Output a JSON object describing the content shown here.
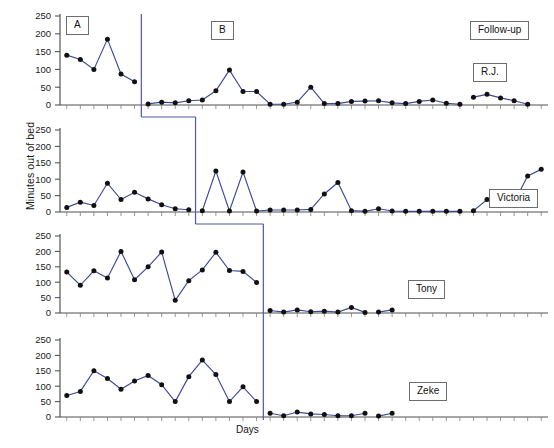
{
  "figure": {
    "ylabel": "Minutes out of bed",
    "xlabel": "Days",
    "phase_labels": [
      {
        "text": "A",
        "x": 66,
        "y": 16
      },
      {
        "text": "B",
        "x": 211,
        "y": 21
      },
      {
        "text": "Follow-up",
        "x": 470,
        "y": 21
      }
    ],
    "subject_labels": [
      {
        "text": "R.J.",
        "x": 473,
        "y": 63
      },
      {
        "text": "Victoria",
        "x": 489,
        "y": 189
      },
      {
        "text": "Tony",
        "x": 408,
        "y": 280
      },
      {
        "text": "Zeke",
        "x": 409,
        "y": 382
      }
    ],
    "colors": {
      "line": "#3d4a9c",
      "marker": "#111111",
      "axis": "#8a8a8a",
      "phase_line": "#4a5aa8",
      "box_border": "#6e6e6e",
      "text": "#1a1a1a",
      "background": "#ffffff"
    }
  },
  "chart_data": {
    "type": "line",
    "title": "",
    "xlabel": "Days",
    "ylabel": "Minutes out of bed",
    "ylim": [
      0,
      250
    ],
    "yticks": [
      0,
      50,
      100,
      150,
      200,
      250
    ],
    "grid": false,
    "legend": "none",
    "design": "multiple-baseline across participants (A / B / Follow-up phases)",
    "panels": [
      {
        "name": "R.J.",
        "phase_change_day": 7,
        "followup_start_day": 31,
        "series": [
          {
            "name": "A",
            "x": [
              1,
              2,
              3,
              4,
              5,
              6
            ],
            "values": [
              140,
              128,
              100,
              185,
              87,
              65
            ]
          },
          {
            "name": "B",
            "x": [
              7,
              8,
              9,
              10,
              11,
              12,
              13,
              14,
              15,
              16,
              17,
              18,
              19,
              20,
              21,
              22,
              23,
              24,
              25,
              26,
              27,
              28,
              29,
              30
            ],
            "values": [
              3,
              8,
              6,
              12,
              14,
              40,
              98,
              38,
              38,
              2,
              2,
              8,
              50,
              4,
              4,
              10,
              11,
              12,
              6,
              4,
              10,
              14,
              5,
              2
            ]
          },
          {
            "name": "Follow-up",
            "x": [
              31,
              32,
              33,
              34,
              35
            ],
            "values": [
              22,
              30,
              20,
              12,
              2
            ]
          }
        ]
      },
      {
        "name": "Victoria",
        "phase_change_day": 11,
        "followup_start_day": 31,
        "series": [
          {
            "name": "A",
            "x": [
              1,
              2,
              3,
              4,
              5,
              6,
              7,
              8,
              9,
              10
            ],
            "values": [
              14,
              30,
              20,
              88,
              38,
              60,
              40,
              22,
              10,
              7
            ]
          },
          {
            "name": "B",
            "x": [
              11,
              12,
              13,
              14,
              15,
              16,
              17,
              18,
              19,
              20,
              21,
              22,
              23,
              24,
              25,
              26,
              27,
              28,
              29,
              30
            ],
            "values": [
              4,
              125,
              3,
              122,
              3,
              6,
              6,
              6,
              8,
              55,
              90,
              4,
              2,
              10,
              3,
              2,
              2,
              2,
              2,
              2
            ]
          },
          {
            "name": "Follow-up",
            "x": [
              31,
              32,
              33,
              34,
              35,
              36
            ],
            "values": [
              4,
              38,
              28,
              30,
              110,
              130
            ]
          }
        ]
      },
      {
        "name": "Tony",
        "phase_change_day": 16,
        "followup_start_day": 31,
        "series": [
          {
            "name": "A",
            "x": [
              1,
              2,
              3,
              4,
              5,
              6,
              7,
              8,
              9,
              10,
              11,
              12,
              13,
              14,
              15
            ],
            "values": [
              133,
              90,
              137,
              114,
              200,
              108,
              150,
              198,
              41,
              105,
              140,
              197,
              138,
              135,
              99
            ]
          },
          {
            "name": "B",
            "x": [
              16,
              17,
              18,
              19,
              20,
              21,
              22,
              23
            ],
            "values": [
              8,
              3,
              10,
              4,
              6,
              3,
              18,
              2
            ]
          },
          {
            "name": "Follow-up",
            "x": [
              24,
              25
            ],
            "values": [
              3,
              10
            ]
          }
        ]
      },
      {
        "name": "Zeke",
        "phase_change_day": 16,
        "followup_start_day": 31,
        "series": [
          {
            "name": "A",
            "x": [
              1,
              2,
              3,
              4,
              5,
              6,
              7,
              8,
              9,
              10,
              11,
              12,
              13,
              14,
              15
            ],
            "values": [
              70,
              83,
              150,
              125,
              90,
              117,
              135,
              105,
              50,
              131,
              185,
              138,
              50,
              98,
              50
            ]
          },
          {
            "name": "B",
            "x": [
              16,
              17,
              18,
              19,
              20,
              21,
              22,
              23
            ],
            "values": [
              12,
              4,
              16,
              10,
              8,
              4,
              4,
              12
            ]
          },
          {
            "name": "Follow-up",
            "x": [
              24,
              25
            ],
            "values": [
              3,
              12
            ]
          }
        ]
      }
    ]
  }
}
